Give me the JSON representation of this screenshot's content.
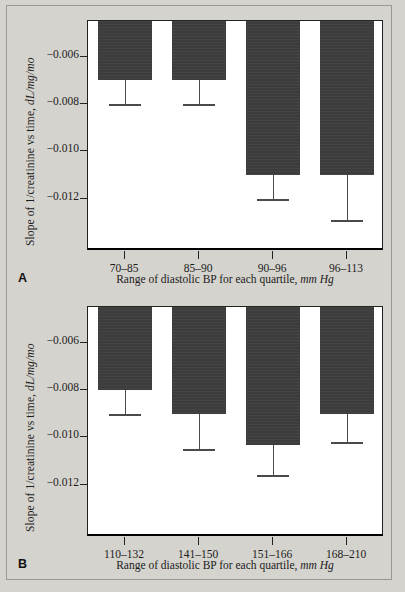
{
  "figure": {
    "background_color": "#d5d3ce",
    "bar_color": "#3c3c3c",
    "axis_color": "#222222"
  },
  "chart_data": [
    {
      "type": "bar",
      "panel_letter": "A",
      "title": "",
      "xlabel": "Range of diastolic BP for each quartile, mm Hg",
      "xlabel_plain": "Range of diastolic BP for each quartile,",
      "xlabel_italic": "mm Hg",
      "ylabel": "Slope of 1/creatinine vs time, dL/mg/mo",
      "ylabel_plain": "Slope of 1/creatinine vs time,",
      "ylabel_italic": "dL/mg/mo",
      "categories": [
        "70–85",
        "85–90",
        "90–96",
        "96–113"
      ],
      "values": [
        -0.007,
        -0.007,
        -0.011,
        -0.011
      ],
      "error_low": [
        -0.008,
        -0.008,
        -0.012,
        -0.0129
      ],
      "ytick_labels": [
        "−0.006",
        "−0.008",
        "−0.010",
        "−0.012"
      ],
      "ytick_values": [
        -0.006,
        -0.008,
        -0.01,
        -0.012
      ],
      "ylim": [
        -0.0142,
        -0.0045
      ],
      "grid": false,
      "legend": "none"
    },
    {
      "type": "bar",
      "panel_letter": "B",
      "title": "",
      "xlabel": "Range of diastolic BP for each quartile, mm Hg",
      "xlabel_plain": "Range of diastolic BP for each quartile,",
      "xlabel_italic": "mm Hg",
      "ylabel": "Slope of 1/creatinine vs time, dL/mg/mo",
      "ylabel_plain": "Slope of 1/creatinine vs time,",
      "ylabel_italic": "dL/mg/mo",
      "categories": [
        "110–132",
        "141–150",
        "151–166",
        "168–210"
      ],
      "values": [
        -0.008,
        -0.009,
        -0.0103,
        -0.009
      ],
      "error_low": [
        -0.009,
        -0.0105,
        -0.0116,
        -0.0102
      ],
      "ytick_labels": [
        "−0.006",
        "−0.008",
        "−0.010",
        "−0.012"
      ],
      "ytick_values": [
        -0.006,
        -0.008,
        -0.01,
        -0.012
      ],
      "ylim": [
        -0.0142,
        -0.0045
      ],
      "grid": false,
      "legend": "none"
    }
  ]
}
